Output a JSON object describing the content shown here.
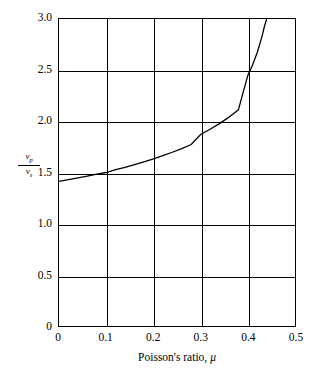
{
  "chart_data": {
    "type": "line",
    "title": "",
    "subtitle": "",
    "xlabel": "Poisson's ratio, μ",
    "ylabel": "v_p / v_s",
    "ylabel_numerator": "v",
    "ylabel_numerator_sub": "p",
    "ylabel_denominator": "v",
    "ylabel_denominator_sub": "s",
    "xlim": [
      0,
      0.5
    ],
    "ylim": [
      0,
      3.0
    ],
    "grid": true,
    "legend": "none",
    "xticks": [
      "0",
      "0.1",
      "0.2",
      "0.3",
      "0.4",
      "0.5"
    ],
    "xtick_values": [
      0,
      0.1,
      0.2,
      0.3,
      0.4,
      0.5
    ],
    "yticks": [
      "0",
      "0.5",
      "1.0",
      "1.5",
      "2.0",
      "2.5",
      "3.0"
    ],
    "ytick_values": [
      0,
      0.5,
      1.0,
      1.5,
      2.0,
      2.5,
      3.0
    ],
    "line_color": "#000000",
    "axis_color": "#000000",
    "background_color": "#ffffff",
    "series": [
      {
        "name": "Vp/Vs vs Poisson's ratio",
        "x": [
          0.0,
          0.02,
          0.04,
          0.06,
          0.08,
          0.1,
          0.12,
          0.14,
          0.16,
          0.18,
          0.2,
          0.22,
          0.24,
          0.26,
          0.28,
          0.3,
          0.32,
          0.34,
          0.36,
          0.38,
          0.4,
          0.41,
          0.42,
          0.43,
          0.435,
          0.44
        ],
        "values": [
          1.414,
          1.43,
          1.447,
          1.465,
          1.484,
          1.5,
          1.527,
          1.551,
          1.577,
          1.605,
          1.633,
          1.664,
          1.698,
          1.734,
          1.773,
          1.871,
          1.922,
          1.978,
          2.041,
          2.112,
          2.449,
          2.55,
          2.673,
          2.828,
          2.924,
          3.0
        ]
      }
    ],
    "annotations": []
  },
  "axes": {
    "x_tick_labels": [
      "0",
      "0.1",
      "0.2",
      "0.3",
      "0.4",
      "0.5"
    ],
    "y_tick_labels": [
      "0",
      "0.5",
      "1.0",
      "1.5",
      "2.0",
      "2.5",
      "3.0"
    ],
    "x_title": "Poisson's ratio, μ"
  }
}
